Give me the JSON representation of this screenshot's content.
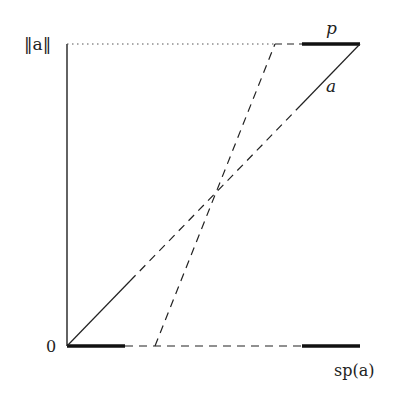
{
  "labels": {
    "y_top": "‖a‖",
    "y_bottom": "0",
    "p": "p",
    "a": "a",
    "sp": "sp(a)"
  },
  "geometry": {
    "origin": [
      67,
      346
    ],
    "top_y": 44,
    "right_x": 360,
    "steep_bottom_x": 155,
    "steep_top_x": 275,
    "segment_left_end_x": 125,
    "segment_right_start_x": 302
  },
  "colors": {
    "stroke": "#222222",
    "dotted": "#555555"
  }
}
